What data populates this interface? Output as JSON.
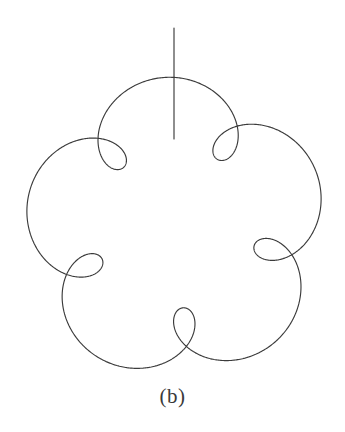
{
  "figure": {
    "caption": "(b)",
    "background_color": "#ffffff",
    "stroke_color": "#3b3b3b",
    "stroke_width": 1.15,
    "width": 345,
    "height": 432
  },
  "chart_data": {
    "type": "line",
    "title": "",
    "subtitle": "",
    "xlabel": "",
    "ylabel": "",
    "legend": [],
    "grid": false,
    "axes_visible": false,
    "tick_labels": [],
    "annotations": [
      {
        "name": "caption",
        "text": "(b)",
        "x": 175,
        "y": 398
      }
    ],
    "curves": [
      {
        "name": "epitrochoid",
        "kind": "epitrochoid",
        "closed": true,
        "center": [
          176,
          228
        ],
        "params": {
          "R": 125,
          "r": 25,
          "d": 46,
          "lobes": 5,
          "phase_deg": -90,
          "rotation_deg": 13
        },
        "t_range": [
          0,
          6.283185307179586
        ],
        "samples": 1600,
        "outer_radius_px": 151,
        "inner_radius_px": 79,
        "lobe_tip_angles_deg": [
          -90,
          -18,
          54,
          126,
          198
        ],
        "lobe_tips_px": [
          [
            176,
            77
          ],
          [
            320,
            182
          ],
          [
            265,
            352
          ],
          [
            87,
            352
          ],
          [
            32,
            182
          ]
        ]
      },
      {
        "name": "radial-arm",
        "kind": "segment",
        "x1": 174,
        "y1": 28,
        "x2": 174,
        "y2": 139
      }
    ]
  },
  "elements": {
    "curve_name": "epitrochoid-curve",
    "arm_name": "radial-arm-line",
    "caption_name": "figure-caption"
  }
}
